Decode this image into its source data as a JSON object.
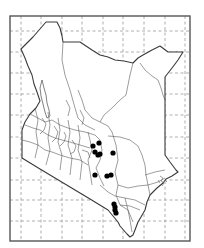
{
  "map": {
    "subject": "Kenya distribution map",
    "frame": {
      "x": 10,
      "y": 16,
      "width": 180,
      "height": 225
    },
    "grid": {
      "vertical_x": [
        21,
        41,
        62,
        82,
        103,
        123,
        144,
        165,
        185
      ],
      "horizontal_y": [
        31,
        52,
        73,
        94,
        115,
        137,
        158,
        180,
        200,
        221
      ]
    },
    "colors": {
      "background": "#ffffff",
      "border": "#3a3a3a",
      "grid": "#9a9a9a",
      "marker": "#000000"
    },
    "occurrence_points": [
      {
        "x": 99,
        "y": 143
      },
      {
        "x": 93,
        "y": 146
      },
      {
        "x": 95,
        "y": 152
      },
      {
        "x": 98,
        "y": 155
      },
      {
        "x": 100,
        "y": 154
      },
      {
        "x": 113,
        "y": 153
      },
      {
        "x": 95,
        "y": 175
      },
      {
        "x": 107,
        "y": 176
      },
      {
        "x": 111,
        "y": 175
      },
      {
        "x": 114,
        "y": 204
      },
      {
        "x": 115,
        "y": 207
      },
      {
        "x": 115,
        "y": 210
      },
      {
        "x": 116,
        "y": 213
      }
    ]
  }
}
